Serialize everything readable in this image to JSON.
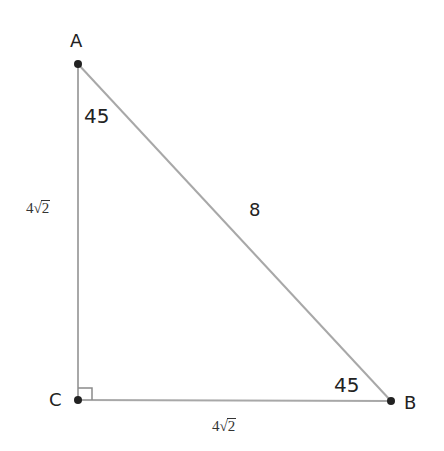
{
  "diagram": {
    "type": "right-triangle",
    "colors": {
      "line": "#a8a8a8",
      "point": "#222222",
      "text": "#222222",
      "background": "#ffffff"
    },
    "vertices": {
      "A": {
        "label": "A",
        "x": 78,
        "y": 64
      },
      "B": {
        "label": "B",
        "x": 391,
        "y": 401
      },
      "C": {
        "label": "C",
        "x": 78,
        "y": 400
      }
    },
    "angles": {
      "A": {
        "label": "45"
      },
      "B": {
        "label": "45"
      },
      "C": {
        "label": "right-angle",
        "marker": "square"
      }
    },
    "sides": {
      "AC": {
        "coef": "4",
        "radicand": "2",
        "text": "4√2"
      },
      "CB": {
        "coef": "4",
        "radicand": "2",
        "text": "4√2"
      },
      "AB": {
        "text": "8"
      }
    }
  }
}
